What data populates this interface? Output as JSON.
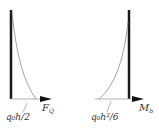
{
  "diagrams": [
    {
      "name": "shear-force",
      "label": "q₀h/2",
      "axis_symbol": "F",
      "axis_subscript": "Q"
    },
    {
      "name": "bending-moment",
      "label": "q₀h²/6",
      "axis_symbol": "M",
      "axis_subscript": "b"
    }
  ],
  "colors": {
    "bar": "#1a1a1a",
    "curve": "#8a8a8a",
    "baseline": "#b0b0b0",
    "arrow": "#111111",
    "text": "#333333"
  }
}
